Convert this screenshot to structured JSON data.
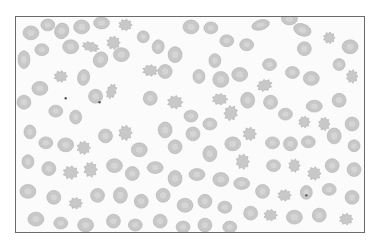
{
  "image": {
    "description": "Peripheral blood smear micrograph showing red blood cells, including crenated echinocytes, in grayscale",
    "subject": "red blood cells",
    "colors": {
      "background": "#fbfbfb",
      "cell_fill": "#c8c8c8",
      "cell_edge": "#b0b0b0",
      "cell_center": "#dadada",
      "border": "#6a6a6a",
      "dot": "#555555"
    }
  }
}
